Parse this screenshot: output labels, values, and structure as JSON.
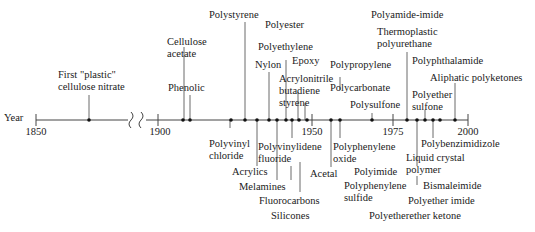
{
  "axis": {
    "label": "Year",
    "ticks": [
      "1850",
      "1900",
      "1950",
      "1975",
      "2000"
    ],
    "break_symbol": "axis-break"
  },
  "events": [
    {
      "name": "First \"plastic\" cellulose nitrate",
      "line1": "First \"plastic\"",
      "line2": "cellulose nitrate",
      "year": 1868
    },
    {
      "name": "Cellulose acetate",
      "line1": "Cellulose",
      "line2": "acetate",
      "year": 1908
    },
    {
      "name": "Phenolic",
      "line1": "Phenolic",
      "year": 1909
    },
    {
      "name": "Polyvinyl chloride",
      "line1": "Polyvinyl",
      "line2": "chloride",
      "year": 1927
    },
    {
      "name": "Polystyrene",
      "line1": "Polystyrene",
      "year": 1930
    },
    {
      "name": "Acrylics",
      "line1": "Acrylics",
      "year": 1936
    },
    {
      "name": "Nylon",
      "line1": "Nylon",
      "year": 1938
    },
    {
      "name": "Melamines",
      "line1": "Melamines",
      "year": 1939
    },
    {
      "name": "Polyester",
      "line1": "Polyester",
      "year": 1942
    },
    {
      "name": "Polyethylene",
      "line1": "Polyethylene",
      "year": 1942
    },
    {
      "name": "Polyvinylidene fluoride",
      "line1": "Polyvinylidene",
      "line2": "fluoride",
      "year": 1943
    },
    {
      "name": "Fluorocarbons",
      "line1": "Fluorocarbons",
      "year": 1943
    },
    {
      "name": "Silicones",
      "line1": "Silicones",
      "year": 1943
    },
    {
      "name": "Epoxy",
      "line1": "Epoxy",
      "year": 1947
    },
    {
      "name": "Acrylonitrile butadiene styrene",
      "line1": "Acrylonitrile",
      "line2": "butadiene",
      "line3": "styrene",
      "year": 1948
    },
    {
      "name": "Acetal",
      "line1": "Acetal",
      "year": 1956
    },
    {
      "name": "Polypropylene",
      "line1": "Polypropylene",
      "year": 1957
    },
    {
      "name": "Polycarbonate",
      "line1": "Polycarbonate",
      "year": 1957
    },
    {
      "name": "Polyphenylene oxide",
      "line1": "Polyphenylene",
      "line2": "oxide",
      "year": 1957
    },
    {
      "name": "Polysulfone",
      "line1": "Polysulfone",
      "year": 1965
    },
    {
      "name": "Polyimide",
      "line1": "Polyimide",
      "year": 1965
    },
    {
      "name": "Polyphenylene sulfide",
      "line1": "Polyphenylene",
      "line2": "sulfide",
      "year": 1968
    },
    {
      "name": "Polyamide-imide",
      "line1": "Polyamide-imide",
      "year": 1972
    },
    {
      "name": "Thermoplastic polyurethane",
      "line1": "Thermoplastic",
      "line2": "polyurethane",
      "year": 1972
    },
    {
      "name": "Liquid crystal polymer",
      "line1": "Liquid crystal",
      "line2": "polymer",
      "year": 1983
    },
    {
      "name": "Polyphthalamide",
      "line1": "Polyphthalamide",
      "year": 1984
    },
    {
      "name": "Polyether sulfone",
      "line1": "Polyether",
      "line2": "sulfone",
      "year": 1985
    },
    {
      "name": "Bismaleimide",
      "line1": "Bismaleimide",
      "year": 1985
    },
    {
      "name": "Polyether imide",
      "line1": "Polyether imide",
      "year": 1986
    },
    {
      "name": "Polyetherether ketone",
      "line1": "Polyetherether ketone",
      "year": 1987
    },
    {
      "name": "Polybenzimidizole",
      "line1": "Polybenzimidizole",
      "year": 1983
    },
    {
      "name": "Aliphatic polyketones",
      "line1": "Aliphatic polyketones",
      "year": 1990
    }
  ]
}
